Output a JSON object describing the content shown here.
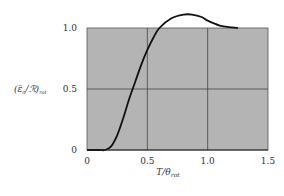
{
  "chart_data": {
    "type": "line",
    "title": "",
    "xlabel": "T/θ_rot",
    "ylabel": "(ε̄_n/ℛ)_rot",
    "xlim": [
      0,
      1.5
    ],
    "ylim": [
      0,
      1.0
    ],
    "grid": true,
    "background": "#b4b4b4",
    "line_color": "#111111",
    "x_ticks": [
      "0",
      "0.5",
      "1.0",
      "1.5"
    ],
    "y_ticks": [
      "0",
      "0.5",
      "1.0"
    ],
    "series": [
      {
        "name": "rotational heat capacity",
        "x": [
          0,
          0.1,
          0.15,
          0.2,
          0.25,
          0.3,
          0.35,
          0.4,
          0.45,
          0.5,
          0.55,
          0.6,
          0.7,
          0.8,
          0.87,
          0.95,
          1.0,
          1.1,
          1.2,
          1.25
        ],
        "y": [
          0,
          0,
          0.0,
          0.03,
          0.12,
          0.26,
          0.42,
          0.56,
          0.7,
          0.82,
          0.92,
          1.0,
          1.08,
          1.11,
          1.11,
          1.09,
          1.06,
          1.02,
          1.005,
          1.0
        ]
      }
    ]
  },
  "axes": {
    "xlabel_main": "T/θ",
    "xlabel_sub": "rot",
    "ylabel_main": "(ε̄",
    "ylabel_sub1": "n",
    "ylabel_mid": "/ℛ)",
    "ylabel_sub2": "rot",
    "x_ticks": [
      "0",
      "0.5",
      "1.0",
      "1.5"
    ],
    "y_ticks": [
      "0",
      "0.5",
      "1.0"
    ]
  }
}
